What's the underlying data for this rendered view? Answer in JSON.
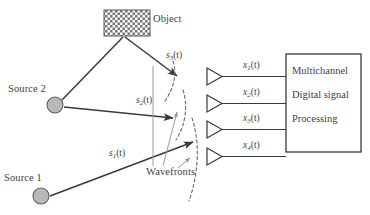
{
  "figure": {
    "type": "array-signal-processing-block-diagram",
    "object": {
      "label": "Object",
      "fill_pattern": "checkerboard",
      "color": "#6e6e6e"
    },
    "sources": [
      {
        "id": "source1",
        "label": "Source 1",
        "signal": {
          "base": "s",
          "index": "1",
          "arg": "(t)"
        }
      },
      {
        "id": "source2",
        "label": "Source 2",
        "signal": {
          "base": "s",
          "index": "2",
          "arg": "(t)"
        }
      }
    ],
    "object_signal": {
      "base": "s",
      "index": "3",
      "arg": "(t)"
    },
    "wavefronts_label": "Wavefronts",
    "sensors": [
      {
        "id": "sensor1",
        "signal": {
          "base": "x",
          "index": "1",
          "arg": "(t)"
        }
      },
      {
        "id": "sensor2",
        "signal": {
          "base": "x",
          "index": "2",
          "arg": "(t)"
        }
      },
      {
        "id": "sensor3",
        "signal": {
          "base": "x",
          "index": "3",
          "arg": "(t)"
        }
      },
      {
        "id": "sensor4",
        "signal": {
          "base": "x",
          "index": "4",
          "arg": "(t)"
        }
      }
    ],
    "processor": {
      "lines": [
        "Multichannel",
        "Digital signal",
        "Processing"
      ]
    },
    "colors": {
      "line": "#3a3a3a",
      "source_fill": "#b9b9b9",
      "leader": "#9a9a9a",
      "dashed": "#6b6b6b",
      "text": "#3f3f3f"
    }
  }
}
